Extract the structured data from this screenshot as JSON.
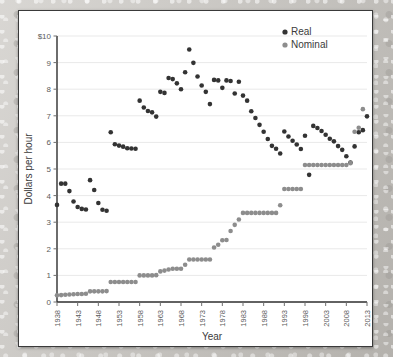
{
  "chart_data": {
    "type": "scatter",
    "title": "",
    "xlabel": "Year",
    "ylabel": "Dollars per hour",
    "xlim": [
      1938,
      2013
    ],
    "ylim": [
      0,
      10
    ],
    "grid": true,
    "legend_position": "top-right",
    "y_ticks": [
      0,
      1,
      2,
      3,
      4,
      5,
      6,
      7,
      8,
      9,
      10
    ],
    "y_tick_labels": [
      "0",
      "1",
      "2",
      "3",
      "4",
      "5",
      "6",
      "7",
      "8",
      "9",
      "$10"
    ],
    "x_ticks": [
      1938,
      1943,
      1948,
      1953,
      1958,
      1963,
      1968,
      1973,
      1978,
      1983,
      1988,
      1993,
      1998,
      2003,
      2008,
      2013
    ],
    "x_tick_labels": [
      "1938",
      "1943",
      "1948",
      "1953",
      "1958",
      "1963",
      "1968",
      "1973",
      "1978",
      "1983",
      "1988",
      "1993",
      "1998",
      "2003",
      "2008",
      "2013"
    ],
    "colors": {
      "real": "#333333",
      "nominal": "#8d8d8d",
      "grid": "#e9e9e9",
      "axis": "#2e2e2e",
      "panel": "#ffffff"
    },
    "series": [
      {
        "name": "Real",
        "color": "#333333",
        "marker": "circle",
        "points": [
          [
            1938,
            3.65
          ],
          [
            1939,
            4.45
          ],
          [
            1940,
            4.45
          ],
          [
            1941,
            4.17
          ],
          [
            1942,
            3.78
          ],
          [
            1943,
            3.57
          ],
          [
            1944,
            3.5
          ],
          [
            1945,
            3.48
          ],
          [
            1946,
            4.58
          ],
          [
            1947,
            4.21
          ],
          [
            1948,
            3.72
          ],
          [
            1949,
            3.47
          ],
          [
            1950,
            3.43
          ],
          [
            1951,
            6.38
          ],
          [
            1952,
            5.93
          ],
          [
            1953,
            5.88
          ],
          [
            1954,
            5.84
          ],
          [
            1955,
            5.78
          ],
          [
            1956,
            5.77
          ],
          [
            1957,
            5.76
          ],
          [
            1958,
            7.57
          ],
          [
            1959,
            7.31
          ],
          [
            1960,
            7.18
          ],
          [
            1961,
            7.13
          ],
          [
            1962,
            6.97
          ],
          [
            1963,
            7.9
          ],
          [
            1964,
            7.86
          ],
          [
            1965,
            8.42
          ],
          [
            1966,
            8.38
          ],
          [
            1967,
            8.22
          ],
          [
            1968,
            8.0
          ],
          [
            1969,
            8.64
          ],
          [
            1970,
            9.49
          ],
          [
            1971,
            8.99
          ],
          [
            1972,
            8.48
          ],
          [
            1973,
            8.14
          ],
          [
            1974,
            7.9
          ],
          [
            1975,
            7.44
          ],
          [
            1976,
            8.35
          ],
          [
            1977,
            8.33
          ],
          [
            1978,
            8.05
          ],
          [
            1979,
            8.33
          ],
          [
            1980,
            8.31
          ],
          [
            1981,
            7.84
          ],
          [
            1982,
            8.28
          ],
          [
            1983,
            7.76
          ],
          [
            1984,
            7.57
          ],
          [
            1985,
            7.17
          ],
          [
            1986,
            6.92
          ],
          [
            1987,
            6.66
          ],
          [
            1988,
            6.4
          ],
          [
            1989,
            6.13
          ],
          [
            1990,
            5.87
          ],
          [
            1991,
            5.76
          ],
          [
            1992,
            5.58
          ],
          [
            1993,
            6.41
          ],
          [
            1994,
            6.22
          ],
          [
            1995,
            6.06
          ],
          [
            1996,
            5.92
          ],
          [
            1997,
            5.75
          ],
          [
            1998,
            6.25
          ],
          [
            1999,
            4.78
          ],
          [
            2000,
            6.62
          ],
          [
            2001,
            6.54
          ],
          [
            2002,
            6.43
          ],
          [
            2003,
            6.29
          ],
          [
            2004,
            6.14
          ],
          [
            2005,
            6.04
          ],
          [
            2006,
            5.86
          ],
          [
            2007,
            5.72
          ],
          [
            2008,
            5.48
          ],
          [
            2009,
            5.24
          ],
          [
            2010,
            5.85
          ],
          [
            2011,
            6.38
          ],
          [
            2012,
            6.46
          ],
          [
            2013,
            6.98
          ]
        ]
      },
      {
        "name": "Nominal",
        "color": "#8d8d8d",
        "marker": "circle",
        "points": [
          [
            1938,
            0.25
          ],
          [
            1939,
            0.26
          ],
          [
            1940,
            0.27
          ],
          [
            1941,
            0.28
          ],
          [
            1942,
            0.29
          ],
          [
            1943,
            0.3
          ],
          [
            1944,
            0.3
          ],
          [
            1945,
            0.31
          ],
          [
            1946,
            0.4
          ],
          [
            1947,
            0.4
          ],
          [
            1948,
            0.4
          ],
          [
            1949,
            0.4
          ],
          [
            1950,
            0.41
          ],
          [
            1951,
            0.75
          ],
          [
            1952,
            0.75
          ],
          [
            1953,
            0.75
          ],
          [
            1954,
            0.75
          ],
          [
            1955,
            0.75
          ],
          [
            1956,
            0.75
          ],
          [
            1957,
            0.75
          ],
          [
            1958,
            1.0
          ],
          [
            1959,
            1.0
          ],
          [
            1960,
            1.0
          ],
          [
            1961,
            1.0
          ],
          [
            1962,
            1.01
          ],
          [
            1963,
            1.15
          ],
          [
            1964,
            1.18
          ],
          [
            1965,
            1.22
          ],
          [
            1966,
            1.25
          ],
          [
            1967,
            1.25
          ],
          [
            1968,
            1.25
          ],
          [
            1969,
            1.4
          ],
          [
            1970,
            1.6
          ],
          [
            1971,
            1.6
          ],
          [
            1972,
            1.6
          ],
          [
            1973,
            1.6
          ],
          [
            1974,
            1.6
          ],
          [
            1975,
            1.6
          ],
          [
            1976,
            2.05
          ],
          [
            1977,
            2.15
          ],
          [
            1978,
            2.32
          ],
          [
            1979,
            2.33
          ],
          [
            1980,
            2.67
          ],
          [
            1981,
            2.9
          ],
          [
            1982,
            3.1
          ],
          [
            1983,
            3.35
          ],
          [
            1984,
            3.35
          ],
          [
            1985,
            3.35
          ],
          [
            1986,
            3.35
          ],
          [
            1987,
            3.35
          ],
          [
            1988,
            3.35
          ],
          [
            1989,
            3.35
          ],
          [
            1990,
            3.35
          ],
          [
            1991,
            3.35
          ],
          [
            1992,
            3.64
          ],
          [
            1993,
            4.25
          ],
          [
            1994,
            4.25
          ],
          [
            1995,
            4.25
          ],
          [
            1996,
            4.25
          ],
          [
            1997,
            4.25
          ],
          [
            1998,
            5.15
          ],
          [
            1999,
            5.15
          ],
          [
            2000,
            5.15
          ],
          [
            2001,
            5.15
          ],
          [
            2002,
            5.15
          ],
          [
            2003,
            5.15
          ],
          [
            2004,
            5.15
          ],
          [
            2005,
            5.15
          ],
          [
            2006,
            5.15
          ],
          [
            2007,
            5.15
          ],
          [
            2008,
            5.15
          ],
          [
            2009,
            5.22
          ],
          [
            2010,
            6.4
          ],
          [
            2011,
            6.55
          ],
          [
            2012,
            7.25
          ]
        ]
      }
    ]
  },
  "legend": {
    "items": [
      {
        "label": "Real",
        "color": "#333333"
      },
      {
        "label": "Nominal",
        "color": "#8d8d8d"
      }
    ]
  }
}
